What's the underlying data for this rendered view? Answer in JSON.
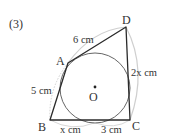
{
  "problem_number": "(3)",
  "figure": {
    "type": "quadrilateral circumscribed about a circle",
    "vertices": {
      "A": {
        "label": "A",
        "x": 68,
        "y": 63
      },
      "B": {
        "label": "B",
        "x": 50,
        "y": 120
      },
      "C": {
        "label": "C",
        "x": 130,
        "y": 120
      },
      "D": {
        "label": "D",
        "x": 126,
        "y": 27
      }
    },
    "circle": {
      "center_label": "O",
      "cx": 95,
      "cy": 88,
      "r": 35
    },
    "lengths": {
      "AD": "6 cm",
      "AB": "5 cm",
      "DC": "2x cm",
      "B_to_tangent": "x cm",
      "tangent_to_C": "3 cm"
    }
  },
  "colors": {
    "line": "#333333",
    "arc": "#c8c8c8",
    "background": "#ffffff"
  }
}
